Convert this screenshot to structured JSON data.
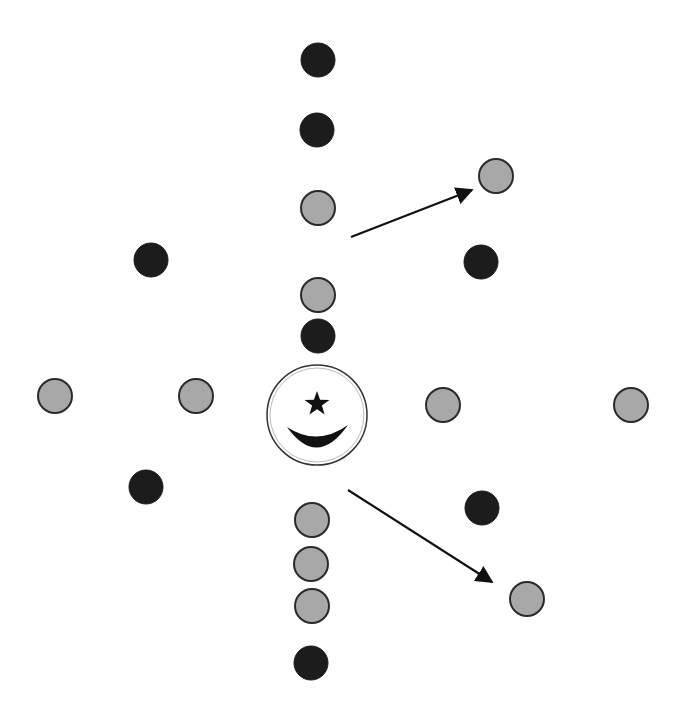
{
  "diagram": {
    "background": "#ffffff",
    "colors": {
      "dark_dot": "#1c1c1c",
      "light_dot": "#a8a8a8",
      "dot_outline": "#2a2a2a",
      "arrow": "#111111",
      "emblem_outline": "#333333",
      "emblem_fill": "#ffffff",
      "emblem_symbol": "#111111"
    },
    "dot_radius": 17,
    "dots": [
      {
        "id": "d1",
        "kind": "dark",
        "x": 318,
        "y": 60
      },
      {
        "id": "d2",
        "kind": "dark",
        "x": 317,
        "y": 130
      },
      {
        "id": "d3",
        "kind": "light",
        "x": 318,
        "y": 208
      },
      {
        "id": "d4",
        "kind": "light",
        "x": 318,
        "y": 295
      },
      {
        "id": "d5",
        "kind": "dark",
        "x": 318,
        "y": 336
      },
      {
        "id": "d6",
        "kind": "dark",
        "x": 151,
        "y": 260
      },
      {
        "id": "d7",
        "kind": "light",
        "x": 55,
        "y": 396
      },
      {
        "id": "d8",
        "kind": "light",
        "x": 196,
        "y": 396
      },
      {
        "id": "d9",
        "kind": "dark",
        "x": 146,
        "y": 487
      },
      {
        "id": "d10",
        "kind": "light",
        "x": 496,
        "y": 176
      },
      {
        "id": "d11",
        "kind": "dark",
        "x": 481,
        "y": 262
      },
      {
        "id": "d12",
        "kind": "light",
        "x": 443,
        "y": 405
      },
      {
        "id": "d13",
        "kind": "light",
        "x": 631,
        "y": 405
      },
      {
        "id": "d14",
        "kind": "dark",
        "x": 482,
        "y": 508
      },
      {
        "id": "d15",
        "kind": "light",
        "x": 527,
        "y": 599
      },
      {
        "id": "d16",
        "kind": "light",
        "x": 312,
        "y": 520
      },
      {
        "id": "d17",
        "kind": "light",
        "x": 311,
        "y": 564
      },
      {
        "id": "d18",
        "kind": "light",
        "x": 312,
        "y": 606
      },
      {
        "id": "d19",
        "kind": "dark",
        "x": 311,
        "y": 663
      }
    ],
    "emblem": {
      "symbol": "star-and-crescent",
      "x": 317,
      "y": 415,
      "r": 50
    },
    "arrows": [
      {
        "id": "a1",
        "x1": 351,
        "y1": 237,
        "x2": 472,
        "y2": 190
      },
      {
        "id": "a2",
        "x1": 348,
        "y1": 490,
        "x2": 492,
        "y2": 582
      }
    ]
  }
}
